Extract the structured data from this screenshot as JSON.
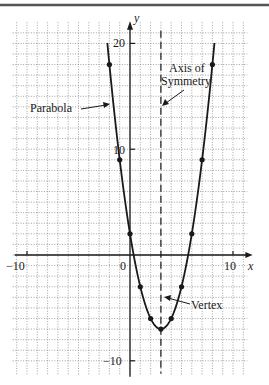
{
  "chart_data": {
    "type": "line",
    "title": "",
    "function": "y = (x - 3)^2 - 7",
    "xlabel": "x",
    "ylabel": "y",
    "xlim": [
      -11,
      11.5
    ],
    "ylim": [
      -11,
      21
    ],
    "grid": true,
    "grid_step": 1,
    "x_tick_labels": [
      {
        "value": -10,
        "label": "−10"
      },
      {
        "value": 0,
        "label": "0"
      },
      {
        "value": 10,
        "label": "10"
      }
    ],
    "y_tick_labels": [
      {
        "value": 20,
        "label": "20"
      },
      {
        "value": 10,
        "label": "10"
      },
      {
        "value": -10,
        "label": "−10"
      }
    ],
    "series": [
      {
        "name": "Parabola",
        "x": [
          -2,
          -1,
          0,
          1,
          2,
          3,
          4,
          5,
          6,
          7,
          8
        ],
        "y": [
          18,
          9,
          2,
          -3,
          -6,
          -7,
          -6,
          -3,
          2,
          9,
          18
        ]
      }
    ],
    "curve_extent": {
      "x_min": -2.2,
      "x_max": 8.2
    },
    "axis_of_symmetry": {
      "x": 3,
      "style": "dashed"
    },
    "vertex": {
      "x": 3,
      "y": -7
    },
    "annotations": [
      {
        "text": "Parabola",
        "target": "curve-left"
      },
      {
        "text": "Axis of\nSymmetry",
        "lines": [
          "Axis of",
          "Symmetry"
        ],
        "target": "axis-of-symmetry"
      },
      {
        "text": "Vertex",
        "target": "vertex"
      }
    ]
  },
  "colors": {
    "ink": "#1a1a1a",
    "grid": "#8a8a8a",
    "background": "#ffffff"
  }
}
